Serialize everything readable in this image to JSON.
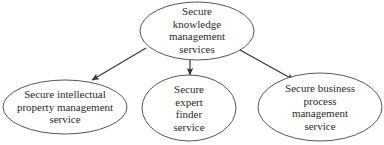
{
  "diagram": {
    "type": "hierarchy",
    "colors": {
      "stroke": "#555555",
      "arrow": "#333333",
      "text": "#2a2a2a",
      "background": "#ffffff"
    },
    "root": {
      "id": "knowledge",
      "label": "Secure\nknowledge\nmanagement\nservices"
    },
    "children": [
      {
        "id": "ip",
        "label": "Secure intellectual\nproperty management\nservice"
      },
      {
        "id": "expert",
        "label": "Secure\nexpert\nfinder\nservice"
      },
      {
        "id": "bpm",
        "label": "Secure business\nprocess\nmanagement\nservice"
      }
    ],
    "edges": [
      {
        "from": "knowledge",
        "to": "ip"
      },
      {
        "from": "knowledge",
        "to": "expert"
      },
      {
        "from": "knowledge",
        "to": "bpm"
      }
    ]
  }
}
